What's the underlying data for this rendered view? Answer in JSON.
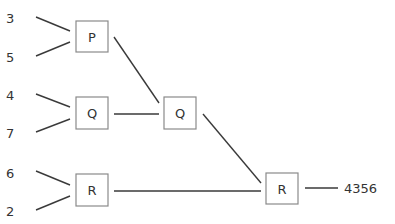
{
  "diagram": {
    "inputs": [
      {
        "id": "in-3",
        "value": "3"
      },
      {
        "id": "in-5",
        "value": "5"
      },
      {
        "id": "in-4",
        "value": "4"
      },
      {
        "id": "in-7",
        "value": "7"
      },
      {
        "id": "in-6",
        "value": "6"
      },
      {
        "id": "in-2",
        "value": "2"
      }
    ],
    "nodes": [
      {
        "id": "p1",
        "label": "P"
      },
      {
        "id": "q1",
        "label": "Q"
      },
      {
        "id": "r1",
        "label": "R"
      },
      {
        "id": "q2",
        "label": "Q"
      },
      {
        "id": "r2",
        "label": "R"
      }
    ],
    "edges": [
      [
        "in-3",
        "p1"
      ],
      [
        "in-5",
        "p1"
      ],
      [
        "in-4",
        "q1"
      ],
      [
        "in-7",
        "q1"
      ],
      [
        "in-6",
        "r1"
      ],
      [
        "in-2",
        "r1"
      ],
      [
        "p1",
        "q2"
      ],
      [
        "q1",
        "q2"
      ],
      [
        "q2",
        "r2"
      ],
      [
        "r1",
        "r2"
      ],
      [
        "r2",
        "output"
      ]
    ],
    "output": "4356"
  }
}
